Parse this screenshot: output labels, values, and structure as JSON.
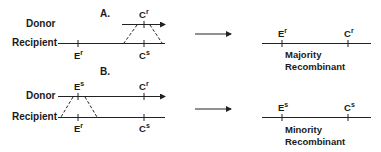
{
  "diagram": {
    "panel_a": {
      "label": "A.",
      "donor_label": "Donor",
      "recipient_label": "Recipient",
      "donor_markers": [
        {
          "gene": "C",
          "allele": "r"
        }
      ],
      "recipient_markers": [
        {
          "gene": "E",
          "allele": "r"
        },
        {
          "gene": "C",
          "allele": "s"
        }
      ],
      "result": {
        "markers": [
          {
            "gene": "E",
            "allele": "r"
          },
          {
            "gene": "C",
            "allele": "r"
          }
        ],
        "caption_line1": "Majority",
        "caption_line2": "Recombinant"
      }
    },
    "panel_b": {
      "label": "B.",
      "donor_label": "Donor",
      "recipient_label": "Recipient",
      "donor_markers": [
        {
          "gene": "E",
          "allele": "s"
        },
        {
          "gene": "C",
          "allele": "r"
        }
      ],
      "recipient_markers": [
        {
          "gene": "E",
          "allele": "r"
        },
        {
          "gene": "C",
          "allele": "s"
        }
      ],
      "result": {
        "markers": [
          {
            "gene": "E",
            "allele": "s"
          },
          {
            "gene": "C",
            "allele": "s"
          }
        ],
        "caption_line1": "Minority",
        "caption_line2": "Recombinant"
      }
    },
    "colors": {
      "line": "#222222",
      "text": "#1a1a1a",
      "background": "#ffffff"
    }
  }
}
